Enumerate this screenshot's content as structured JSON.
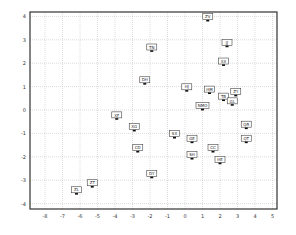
{
  "chart_data": {
    "type": "scatter",
    "title": "",
    "xlabel": "",
    "ylabel": "",
    "xlim": [
      -8.5,
      5.2
    ],
    "ylim": [
      -4.2,
      4.3
    ],
    "x_ticks": [
      -8,
      -7,
      -6,
      -5,
      -4,
      -3,
      -2,
      -1,
      0,
      1,
      2,
      3,
      4,
      5
    ],
    "y_ticks": [
      -4,
      -3,
      -2,
      -1,
      0,
      1,
      2,
      3,
      4
    ],
    "grid": true,
    "legend": null,
    "points": [
      {
        "label": "ZV",
        "x": 1.3,
        "y": 3.8
      },
      {
        "label": "JJ",
        "x": 2.4,
        "y": 2.7
      },
      {
        "label": "XX",
        "x": 2.2,
        "y": 1.9
      },
      {
        "label": "TN",
        "x": -1.9,
        "y": 2.5
      },
      {
        "label": "DH",
        "x": -2.3,
        "y": 1.1
      },
      {
        "label": "HJ",
        "x": 0.1,
        "y": 0.8
      },
      {
        "label": "HM",
        "x": 1.4,
        "y": 0.7
      },
      {
        "label": "ZY",
        "x": 2.9,
        "y": 0.6
      },
      {
        "label": "TB",
        "x": 2.2,
        "y": 0.4
      },
      {
        "label": "GL",
        "x": 2.7,
        "y": 0.2
      },
      {
        "label": "NMO",
        "x": 1.0,
        "y": 0.0
      },
      {
        "label": "XF",
        "x": -3.9,
        "y": -0.4
      },
      {
        "label": "XG",
        "x": -2.9,
        "y": -0.9
      },
      {
        "label": "SX",
        "x": -0.6,
        "y": -1.2
      },
      {
        "label": "QR",
        "x": 3.5,
        "y": -0.8
      },
      {
        "label": "QT",
        "x": 3.5,
        "y": -1.4
      },
      {
        "label": "GE",
        "x": 0.4,
        "y": -1.4
      },
      {
        "label": "CC",
        "x": 1.6,
        "y": -1.8
      },
      {
        "label": "CD",
        "x": -2.7,
        "y": -1.8
      },
      {
        "label": "SH",
        "x": 0.4,
        "y": -2.1
      },
      {
        "label": "HE",
        "x": 2.0,
        "y": -2.3
      },
      {
        "label": "DY",
        "x": -1.9,
        "y": -2.9
      },
      {
        "label": "ZT",
        "x": -5.3,
        "y": -3.3
      },
      {
        "label": "ZL",
        "x": -6.2,
        "y": -3.6
      }
    ]
  },
  "layout": {
    "frame": {
      "left": 30,
      "top": 12,
      "right": 277,
      "bottom": 209
    },
    "x_px_per_unit": 17.5,
    "x_zero_px": 185,
    "y_px_per_unit": 23.4,
    "y_zero_px": 110,
    "colors": {
      "frame": "#333333",
      "grid": "#b8b8b8",
      "box": "#444444",
      "box_fill": "#ffffff",
      "marker": "#111111"
    }
  }
}
